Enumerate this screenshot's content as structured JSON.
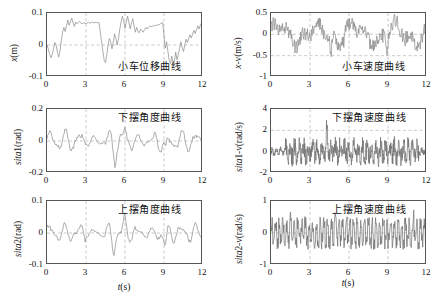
{
  "figure": {
    "xlabel_text": "t(s)",
    "xlabel_italic": "t",
    "xlabel_rest": "(s)"
  },
  "chart_data": [
    {
      "id": "cart-displacement",
      "type": "line",
      "title": "小车位移曲线",
      "title_en": "Cart displacement curve",
      "xlabel": "t(s)",
      "ylabel": "x(m)",
      "ylabel_italic": "x",
      "ylabel_rest": "(m)",
      "xlim": [
        0,
        12
      ],
      "ylim": [
        -0.1,
        0.1
      ],
      "xticks": [
        0,
        3,
        6,
        9,
        12
      ],
      "yticks": [
        0.1,
        0,
        -0.1
      ],
      "ytick_labels": [
        "0.1",
        "0",
        "-0.1"
      ],
      "grid": true,
      "gridlines_x": [
        3,
        6,
        9
      ],
      "gridlines_y": [
        0
      ],
      "series": [
        {
          "name": "x",
          "color": "#8a8a8a",
          "x": [
            0,
            0.1,
            0.2,
            0.3,
            0.4,
            0.5,
            0.6,
            0.7,
            0.8,
            0.9,
            1.0,
            1.1,
            1.2,
            1.3,
            1.4,
            1.5,
            1.6,
            1.7,
            1.8,
            1.9,
            2.0,
            2.1,
            2.2,
            2.3,
            2.4,
            2.5,
            2.6,
            2.7,
            2.8,
            2.9,
            3.0,
            3.1,
            3.2,
            3.3,
            3.4,
            3.5,
            3.6,
            3.7,
            3.8,
            3.9,
            4.0,
            4.1,
            4.2,
            4.3,
            4.4,
            4.5,
            4.6,
            4.7,
            4.8,
            4.9,
            5.0,
            5.1,
            5.2,
            5.3,
            5.4,
            5.5,
            5.6,
            5.7,
            5.8,
            5.9,
            6.0,
            6.1,
            6.2,
            6.3,
            6.4,
            6.5,
            6.6,
            6.7,
            6.8,
            6.9,
            7.0,
            7.1,
            7.2,
            7.3,
            7.4,
            7.5,
            7.6,
            7.7,
            7.8,
            7.9,
            8.0,
            8.1,
            8.2,
            8.3,
            8.4,
            8.5,
            8.6,
            8.7,
            8.8,
            8.9,
            9.0,
            9.1,
            9.2,
            9.3,
            9.4,
            9.5,
            9.6,
            9.7,
            9.8,
            9.9,
            10.0,
            10.1,
            10.2,
            10.3,
            10.4,
            10.5,
            10.6,
            10.7,
            10.8,
            10.9,
            11.0,
            11.1,
            11.2,
            11.3,
            11.4,
            11.5,
            11.6,
            11.7,
            11.8,
            11.9,
            12.0
          ],
          "y": [
            0,
            -0.012,
            -0.028,
            -0.04,
            -0.03,
            -0.012,
            0.008,
            0.0,
            -0.022,
            -0.038,
            -0.018,
            0.014,
            0.04,
            0.055,
            0.042,
            0.06,
            0.078,
            0.062,
            0.072,
            0.084,
            0.07,
            0.058,
            0.072,
            0.066,
            0.07,
            0.074,
            0.069,
            0.066,
            0.07,
            0.068,
            0.067,
            0.069,
            0.071,
            0.068,
            0.07,
            0.072,
            0.069,
            0.071,
            0.07,
            0.07,
            0.07,
            0.04,
            0.01,
            -0.02,
            -0.048,
            -0.055,
            -0.03,
            0.0,
            0.02,
            0.01,
            -0.012,
            0.01,
            0.035,
            0.02,
            0.0,
            0.02,
            0.05,
            0.072,
            0.09,
            0.075,
            0.052,
            0.072,
            0.09,
            0.07,
            0.05,
            0.07,
            0.082,
            0.06,
            0.04,
            0.055,
            0.042,
            0.038,
            0.05,
            0.045,
            0.04,
            0.048,
            0.055,
            0.05,
            0.056,
            0.06,
            0.056,
            0.06,
            0.058,
            0.062,
            0.06,
            0.064,
            0.062,
            0.066,
            0.068,
            0.07,
            0.03,
            -0.01,
            0.01,
            -0.02,
            -0.048,
            -0.058,
            -0.035,
            -0.06,
            -0.05,
            -0.022,
            -0.046,
            -0.03,
            -0.01,
            0.01,
            -0.008,
            -0.02,
            0.0,
            0.018,
            0.008,
            0.02,
            0.032,
            0.022,
            0.034,
            0.046,
            0.036,
            0.048,
            0.06,
            0.05,
            0.062,
            0.07
          ]
        }
      ]
    },
    {
      "id": "cart-velocity",
      "type": "line",
      "title": "小车速度曲线",
      "title_en": "Cart velocity curve",
      "xlabel": "t(s)",
      "ylabel": "x-v(m/s)",
      "ylabel_italic": "x",
      "ylabel_rest": "-v(m/s)",
      "xlim": [
        0,
        12
      ],
      "ylim": [
        -1,
        0.5
      ],
      "xticks": [
        0,
        3,
        6,
        9,
        12
      ],
      "yticks": [
        0.5,
        0,
        -0.5,
        -1
      ],
      "ytick_labels": [
        "0.5",
        "0",
        "-0.5",
        "-1"
      ],
      "grid": true,
      "gridlines_x": [
        3,
        6,
        9
      ],
      "gridlines_y": [
        0,
        -0.5
      ],
      "noise": {
        "amplitude": 0.18,
        "seed": 7,
        "density": 0.04
      },
      "series": [
        {
          "name": "x-v",
          "color": "#8a8a8a",
          "description": "Noisy oscillatory velocity signal oscillating mostly between -0.35 and 0.35 with spikes to +0.45 near t=5.8 and dips to -0.55 near t=4.6 and -0.55 near t=8.9"
        }
      ]
    },
    {
      "id": "lower-pendulum-angle",
      "type": "line",
      "title": "下摆角度曲线",
      "title_en": "Lower pendulum angle curve",
      "xlabel": "t(s)",
      "ylabel": "sita1(rad)",
      "ylabel_italic": "sita",
      "ylabel_rest": "1(rad)",
      "xlim": [
        0,
        12
      ],
      "ylim": [
        -0.2,
        0.2
      ],
      "xticks": [
        0,
        3,
        6,
        9,
        12
      ],
      "yticks": [
        0.2,
        0,
        -0.2
      ],
      "ytick_labels": [
        "0.2",
        "0",
        "-0.2"
      ],
      "grid": true,
      "gridlines_x": [
        3,
        6,
        9
      ],
      "gridlines_y": [
        0
      ],
      "noise": {
        "amplitude": 0.055,
        "seed": 13,
        "density": 0.055
      },
      "series": [
        {
          "name": "sita1",
          "color": "#8a8a8a",
          "description": "Oscillatory angle signal, envelope about ±0.07 rad with larger excursions to -0.17 near t=5.2 and -0.13 near t=9.1"
        }
      ]
    },
    {
      "id": "lower-pendulum-angular-velocity",
      "type": "line",
      "title": "下摆角速度曲线",
      "title_en": "Lower pendulum angular velocity curve",
      "xlabel": "t(s)",
      "ylabel": "sita1-v(rad/s)",
      "ylabel_italic": "sita",
      "ylabel_rest": "1-v(rad/s)",
      "xlim": [
        0,
        12
      ],
      "ylim": [
        -2,
        4
      ],
      "xticks": [
        0,
        3,
        6,
        9,
        12
      ],
      "yticks": [
        4,
        2,
        0,
        -2
      ],
      "ytick_labels": [
        "4",
        "2",
        "0",
        "-2"
      ],
      "grid": true,
      "gridlines_x": [
        3,
        6,
        9
      ],
      "gridlines_y": [
        0,
        2
      ],
      "noise": {
        "amplitude": 0.75,
        "seed": 23,
        "density": 0.022
      },
      "series": [
        {
          "name": "sita1-v",
          "color": "#6e6e6e",
          "description": "Dense high frequency noise band roughly ±1 rad/s with peak near 2.6 at t=4.3 and minima near -1.6"
        }
      ]
    },
    {
      "id": "upper-pendulum-angle",
      "type": "line",
      "title": "上摆角度曲线",
      "title_en": "Upper pendulum angle curve",
      "xlabel": "t(s)",
      "ylabel": "sita2(rad)",
      "ylabel_italic": "sita",
      "ylabel_rest": "2(rad)",
      "xlim": [
        0,
        12
      ],
      "ylim": [
        -0.1,
        0.1
      ],
      "xticks": [
        0,
        3,
        6,
        9,
        12
      ],
      "yticks": [
        0.1,
        0,
        -0.1
      ],
      "ytick_labels": [
        "0.1",
        "0",
        "-0.1"
      ],
      "grid": true,
      "gridlines_x": [
        3,
        6,
        9
      ],
      "gridlines_y": [
        0
      ],
      "noise": {
        "amplitude": 0.026,
        "seed": 31,
        "density": 0.06
      },
      "series": [
        {
          "name": "sita2",
          "color": "#8a8a8a",
          "description": "Oscillatory angle signal, envelope about ±0.03 rad with deep excursion to -0.075 near t=5.1 and -0.07 near t=9.1"
        }
      ]
    },
    {
      "id": "upper-pendulum-angular-velocity",
      "type": "line",
      "title": "上摆角速度曲线",
      "title_en": "Upper pendulum angular velocity curve",
      "xlabel": "t(s)",
      "ylabel": "sita2-v(rad/s)",
      "ylabel_italic": "sita",
      "ylabel_rest": "2-v(rad/s)",
      "xlim": [
        0,
        12
      ],
      "ylim": [
        -1,
        1
      ],
      "xticks": [
        0,
        3,
        6,
        9,
        12
      ],
      "yticks": [
        1,
        0,
        -1
      ],
      "ytick_labels": [
        "1",
        "0",
        "-1"
      ],
      "grid": true,
      "gridlines_x": [
        3,
        6,
        9
      ],
      "gridlines_y": [
        0
      ],
      "noise": {
        "amplitude": 0.34,
        "seed": 41,
        "density": 0.03
      },
      "series": [
        {
          "name": "sita2-v",
          "color": "#6e6e6e",
          "description": "Square-ish dense noise band roughly ±0.45 rad/s with peak 0.72 near t=5.0 and 0.62 near t=1.5"
        }
      ]
    }
  ]
}
